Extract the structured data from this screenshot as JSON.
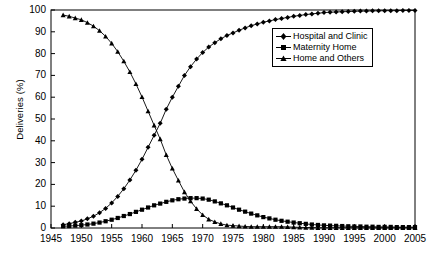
{
  "chart_data": {
    "type": "line",
    "title": "",
    "xlabel": "",
    "ylabel": "Deliveries (%)",
    "xlim": [
      1945,
      2005
    ],
    "ylim": [
      0,
      100
    ],
    "xticks": [
      1945,
      1950,
      1955,
      1960,
      1965,
      1970,
      1975,
      1980,
      1985,
      1990,
      1995,
      2000,
      2005
    ],
    "yticks": [
      0,
      10,
      20,
      30,
      40,
      50,
      60,
      70,
      80,
      90,
      100
    ],
    "grid": false,
    "legend_position": "upper right",
    "x": [
      1947,
      1948,
      1949,
      1950,
      1951,
      1952,
      1953,
      1954,
      1955,
      1956,
      1957,
      1958,
      1959,
      1960,
      1961,
      1962,
      1963,
      1964,
      1965,
      1966,
      1967,
      1968,
      1969,
      1970,
      1971,
      1972,
      1973,
      1974,
      1975,
      1976,
      1977,
      1978,
      1979,
      1980,
      1981,
      1982,
      1983,
      1984,
      1985,
      1986,
      1987,
      1988,
      1989,
      1990,
      1991,
      1992,
      1993,
      1994,
      1995,
      1996,
      1997,
      1998,
      1999,
      2000,
      2001,
      2002,
      2003,
      2004,
      2005
    ],
    "series": [
      {
        "name": "Hospital and Clinic",
        "marker": "diamond",
        "values": [
          1.5,
          2.0,
          2.6,
          3.2,
          4.2,
          5.4,
          7.0,
          9.0,
          11.5,
          14.5,
          18.0,
          22.0,
          26.5,
          31.5,
          37.0,
          42.5,
          48.0,
          54.5,
          60.0,
          65.0,
          70.0,
          74.0,
          77.5,
          80.5,
          83.0,
          85.0,
          86.8,
          88.3,
          89.5,
          90.7,
          91.8,
          92.8,
          93.6,
          94.4,
          95.0,
          95.6,
          96.1,
          96.6,
          97.1,
          97.5,
          97.9,
          98.2,
          98.5,
          98.8,
          99.0,
          99.1,
          99.2,
          99.3,
          99.4,
          99.5,
          99.5,
          99.6,
          99.6,
          99.7,
          99.7,
          99.7,
          99.8,
          99.8,
          99.8
        ]
      },
      {
        "name": "Maternity Home",
        "marker": "square",
        "values": [
          0.8,
          0.9,
          1.1,
          1.3,
          1.6,
          2.0,
          2.5,
          3.1,
          3.8,
          4.6,
          5.5,
          6.4,
          7.4,
          8.4,
          9.4,
          10.4,
          11.2,
          12.0,
          12.7,
          13.2,
          13.5,
          13.7,
          13.7,
          13.5,
          13.0,
          12.2,
          11.3,
          10.4,
          9.4,
          8.4,
          7.5,
          6.6,
          5.8,
          5.0,
          4.4,
          3.8,
          3.3,
          2.9,
          2.5,
          2.2,
          1.9,
          1.6,
          1.4,
          1.2,
          1.1,
          1.0,
          0.9,
          0.8,
          0.7,
          0.7,
          0.6,
          0.6,
          0.5,
          0.5,
          0.5,
          0.4,
          0.4,
          0.4,
          0.4
        ]
      },
      {
        "name": "Home and Others",
        "marker": "triangle",
        "values": [
          97.7,
          97.1,
          96.3,
          95.5,
          94.2,
          92.6,
          90.5,
          87.9,
          84.7,
          80.9,
          76.5,
          71.6,
          66.1,
          60.1,
          53.6,
          47.1,
          40.8,
          33.5,
          27.3,
          21.8,
          16.5,
          12.3,
          8.8,
          6.0,
          4.0,
          2.8,
          1.9,
          1.3,
          1.1,
          0.9,
          0.7,
          0.6,
          0.6,
          0.6,
          0.6,
          0.6,
          0.6,
          0.5,
          0.4,
          0.3,
          0.2,
          0.2,
          0.1,
          0.1,
          0.1,
          0.1,
          0.1,
          0.1,
          0.1,
          0.1,
          0.1,
          0.1,
          0.1,
          0.1,
          0.1,
          0.1,
          0.1,
          0.1,
          0.1
        ]
      }
    ]
  },
  "legend": {
    "items": [
      {
        "label": "Hospital and Clinic"
      },
      {
        "label": "Maternity Home"
      },
      {
        "label": "Home and Others"
      }
    ]
  },
  "colors": {
    "line": "#000000",
    "axis": "#000000",
    "background": "#ffffff"
  }
}
